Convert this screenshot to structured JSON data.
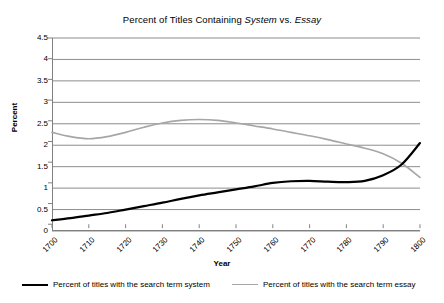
{
  "chart_data": {
    "type": "line",
    "title": "Percent of Titles Containing System vs. Essay",
    "title_parts": [
      {
        "text": "Percent of Titles Containing ",
        "italic": false
      },
      {
        "text": "System",
        "italic": true
      },
      {
        "text": " vs. ",
        "italic": false
      },
      {
        "text": "Essay",
        "italic": true
      }
    ],
    "xlabel": "Year",
    "ylabel": "Percent",
    "xlim": [
      1700,
      1800
    ],
    "ylim": [
      0,
      4.5
    ],
    "ytick_values": [
      0,
      0.5,
      1,
      1.5,
      2,
      2.5,
      3,
      3.5,
      4,
      4.5
    ],
    "ytick_labels": [
      "0",
      "0.5",
      "1",
      "1.5",
      "2",
      "2.5",
      "3",
      "3.5",
      "4",
      "4.5"
    ],
    "xtick_values": [
      1700,
      1710,
      1720,
      1730,
      1740,
      1750,
      1760,
      1770,
      1780,
      1790,
      1800
    ],
    "xtick_labels": [
      "1700",
      "1710",
      "1720",
      "1730",
      "1740",
      "1750",
      "1760",
      "1770",
      "1780",
      "1790",
      "1800"
    ],
    "grid": "horizontal",
    "legend_position": "bottom",
    "x": [
      1700,
      1705,
      1710,
      1715,
      1720,
      1725,
      1730,
      1735,
      1740,
      1745,
      1750,
      1755,
      1760,
      1765,
      1770,
      1775,
      1780,
      1785,
      1790,
      1795,
      1800
    ],
    "series": [
      {
        "name": "Percent of titles with the search term system",
        "color": "#000000",
        "width": 2.2,
        "values": [
          0.25,
          0.3,
          0.36,
          0.42,
          0.5,
          0.58,
          0.66,
          0.75,
          0.83,
          0.9,
          0.97,
          1.04,
          1.12,
          1.16,
          1.17,
          1.15,
          1.14,
          1.17,
          1.3,
          1.55,
          2.05
        ]
      },
      {
        "name": "Percent of titles with the search term essay",
        "color": "#a6a6a6",
        "width": 1.6,
        "values": [
          2.3,
          2.2,
          2.15,
          2.2,
          2.3,
          2.42,
          2.52,
          2.58,
          2.6,
          2.58,
          2.52,
          2.45,
          2.38,
          2.3,
          2.22,
          2.13,
          2.03,
          1.93,
          1.8,
          1.58,
          1.25
        ]
      }
    ],
    "annotations": {
      "crossover_year": 1796,
      "crossover_value": 1.5
    }
  }
}
